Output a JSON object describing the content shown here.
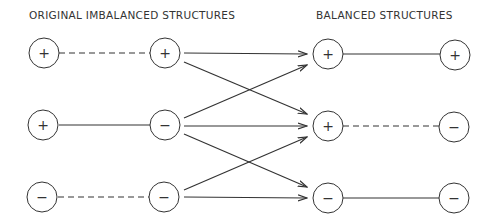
{
  "titles": {
    "left": "ORIGINAL  IMBALANCED  STRUCTURES",
    "right": "BALANCED  STRUCTURES"
  },
  "original_structures": [
    {
      "a": "+",
      "b": "+",
      "relation": "negative (dashed)"
    },
    {
      "a": "+",
      "b": "−",
      "relation": "positive (solid)"
    },
    {
      "a": "−",
      "b": "−",
      "relation": "negative (dashed)"
    }
  ],
  "balanced_structures": [
    {
      "a": "+",
      "b": "+",
      "relation": "positive (solid)"
    },
    {
      "a": "+",
      "b": "−",
      "relation": "negative (dashed)"
    },
    {
      "a": "−",
      "b": "−",
      "relation": "positive (solid)"
    }
  ],
  "transitions": [
    {
      "from": 0,
      "to": 0
    },
    {
      "from": 0,
      "to": 1
    },
    {
      "from": 1,
      "to": 0
    },
    {
      "from": 1,
      "to": 1
    },
    {
      "from": 1,
      "to": 2
    },
    {
      "from": 2,
      "to": 1
    },
    {
      "from": 2,
      "to": 2
    }
  ],
  "signs": {
    "r0": {
      "c1": "+",
      "c2": "+",
      "c3": "+",
      "c4": "+"
    },
    "r1": {
      "c1": "+",
      "c2": "−",
      "c3": "+",
      "c4": "−"
    },
    "r2": {
      "c1": "−",
      "c2": "−",
      "c3": "−",
      "c4": "−"
    }
  }
}
